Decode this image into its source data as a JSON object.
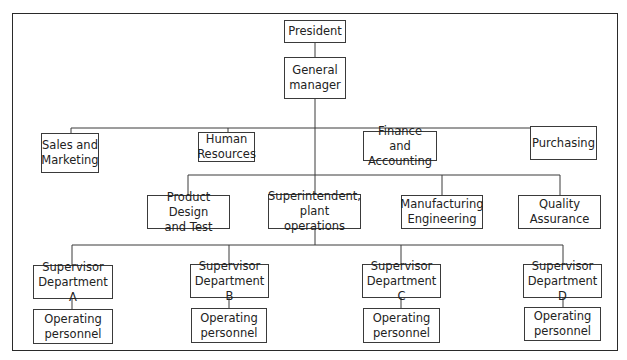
{
  "chart_title": "",
  "colors": {
    "line": "#3a3a3a",
    "border": "#2a2a2a",
    "text": "#222222",
    "background": "#ffffff"
  },
  "nodes": {
    "president": "President",
    "general_manager": "General\nmanager",
    "sales_marketing": "Sales and\nMarketing",
    "human_resources": "Human\nResources",
    "finance_accounting": "Finance and\nAccounting",
    "purchasing": "Purchasing",
    "product_design": "Product Design\nand Test",
    "superintendent": "Superintendent,\nplant operations",
    "manufacturing_engineering": "Manufacturing\nEngineering",
    "quality_assurance": "Quality\nAssurance",
    "supervisor_a": "Supervisor\nDepartment A",
    "supervisor_b": "Supervisor\nDepartment B",
    "supervisor_c": "Supervisor\nDepartment C",
    "supervisor_d": "Supervisor\nDepartment D",
    "operating_a": "Operating\npersonnel",
    "operating_b": "Operating\npersonnel",
    "operating_c": "Operating\npersonnel",
    "operating_d": "Operating\npersonnel"
  },
  "hierarchy": {
    "President": [
      "General manager"
    ],
    "General manager": [
      "Sales and Marketing",
      "Human Resources",
      "Finance and Accounting",
      "Purchasing",
      "Product Design and Test",
      "Superintendent, plant operations",
      "Manufacturing Engineering",
      "Quality Assurance"
    ],
    "Superintendent, plant operations": [
      "Supervisor Department A",
      "Supervisor Department B",
      "Supervisor Department C",
      "Supervisor Department D"
    ],
    "Supervisor Department A": [
      "Operating personnel"
    ],
    "Supervisor Department B": [
      "Operating personnel"
    ],
    "Supervisor Department C": [
      "Operating personnel"
    ],
    "Supervisor Department D": [
      "Operating personnel"
    ]
  }
}
